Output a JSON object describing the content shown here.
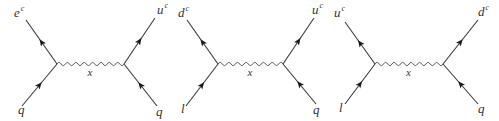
{
  "diagrams": [
    {
      "id": "diagram-1",
      "mediator": "x",
      "left_vertex": [
        57,
        64
      ],
      "right_vertex": [
        124,
        64
      ],
      "legs": {
        "top_left": {
          "label": "e",
          "sup": "c",
          "end": [
            26,
            20
          ],
          "label_pos": [
            14,
            17
          ]
        },
        "bottom_left": {
          "label": "q",
          "sup": "",
          "end": [
            22,
            106
          ],
          "label_pos": [
            18,
            114
          ]
        },
        "top_right": {
          "label": "u",
          "sup": "c",
          "end": [
            155,
            18
          ],
          "label_pos": [
            157,
            14
          ]
        },
        "bottom_right": {
          "label": "q",
          "sup": "",
          "end": [
            157,
            106
          ],
          "label_pos": [
            156,
            116
          ]
        }
      }
    },
    {
      "id": "diagram-2",
      "mediator": "x",
      "left_vertex": [
        218,
        64
      ],
      "right_vertex": [
        283,
        64
      ],
      "legs": {
        "top_left": {
          "label": "d",
          "sup": "c",
          "end": [
            187,
            20
          ],
          "label_pos": [
            178,
            17
          ]
        },
        "bottom_left": {
          "label": "l",
          "sup": "",
          "end": [
            186,
            106
          ],
          "label_pos": [
            181,
            113
          ]
        },
        "top_right": {
          "label": "u",
          "sup": "c",
          "end": [
            314,
            18
          ],
          "label_pos": [
            312,
            14
          ]
        },
        "bottom_right": {
          "label": "q",
          "sup": "",
          "end": [
            316,
            104
          ],
          "label_pos": [
            313,
            114
          ]
        }
      }
    },
    {
      "id": "diagram-3",
      "mediator": "x",
      "left_vertex": [
        375,
        64
      ],
      "right_vertex": [
        443,
        64
      ],
      "legs": {
        "top_left": {
          "label": "u",
          "sup": "c",
          "end": [
            345,
            22
          ],
          "label_pos": [
            334,
            17
          ]
        },
        "bottom_left": {
          "label": "l",
          "sup": "",
          "end": [
            345,
            104
          ],
          "label_pos": [
            339,
            112
          ]
        },
        "top_right": {
          "label": "d",
          "sup": "c",
          "end": [
            478,
            20
          ],
          "label_pos": [
            478,
            16
          ]
        },
        "bottom_right": {
          "label": "q",
          "sup": "",
          "end": [
            478,
            104
          ],
          "label_pos": [
            478,
            113
          ]
        }
      }
    }
  ],
  "colors": {
    "line": "#3a3a3a",
    "arrow": "#1a1a1a",
    "background": "#ffffff"
  }
}
